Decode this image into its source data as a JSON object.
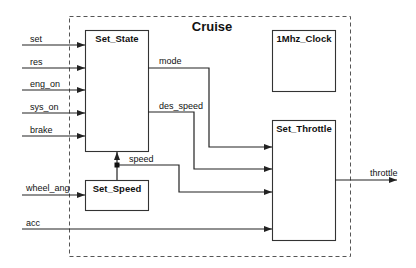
{
  "diagram": {
    "container": {
      "title": "Cruise",
      "style": "dashed"
    },
    "blocks": [
      {
        "id": "set_state",
        "label": "Set_State"
      },
      {
        "id": "clock",
        "label": "1Mhz_Clock"
      },
      {
        "id": "set_throttle",
        "label": "Set_Throttle"
      },
      {
        "id": "set_speed",
        "label": "Set_Speed"
      }
    ],
    "inputs": [
      {
        "label": "set",
        "target": "Set_State"
      },
      {
        "label": "res",
        "target": "Set_State"
      },
      {
        "label": "eng_on",
        "target": "Set_State"
      },
      {
        "label": "sys_on",
        "target": "Set_State"
      },
      {
        "label": "brake",
        "target": "Set_State"
      },
      {
        "label": "wheel_ang",
        "target": "Set_Speed"
      },
      {
        "label": "acc",
        "target": "Set_Throttle"
      }
    ],
    "internal_signals": [
      {
        "label": "mode",
        "from": "Set_State",
        "to": "Set_Throttle"
      },
      {
        "label": "des_speed",
        "from": "Set_State",
        "to": "Set_Throttle"
      },
      {
        "label": "speed",
        "from": "Set_Speed",
        "to": "Set_State, Set_Throttle"
      }
    ],
    "outputs": [
      {
        "label": "throttle",
        "from": "Set_Throttle"
      }
    ]
  }
}
